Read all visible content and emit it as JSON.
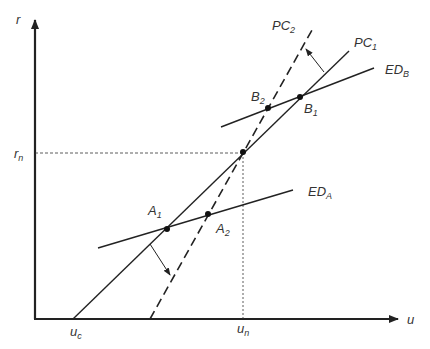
{
  "axes": {
    "y_label": "r",
    "x_label": "u",
    "y_marker": {
      "base": "r",
      "sub": "n"
    },
    "x_markers": [
      {
        "base": "u",
        "sub": "c"
      },
      {
        "base": "u",
        "sub": "n"
      }
    ]
  },
  "curves": {
    "pc1": {
      "base": "PC",
      "sub": "1",
      "style": "solid"
    },
    "pc2": {
      "base": "PC",
      "sub": "2",
      "style": "dashed"
    },
    "edb": {
      "base": "ED",
      "sub": "B",
      "style": "solid"
    },
    "eda": {
      "base": "ED",
      "sub": "A",
      "style": "solid"
    }
  },
  "points": {
    "a1": {
      "base": "A",
      "sub": "1"
    },
    "a2": {
      "base": "A",
      "sub": "2"
    },
    "b1": {
      "base": "B",
      "sub": "1"
    },
    "b2": {
      "base": "B",
      "sub": "2"
    }
  },
  "colors": {
    "line": "#222222",
    "text": "#333333",
    "background": "#ffffff"
  }
}
